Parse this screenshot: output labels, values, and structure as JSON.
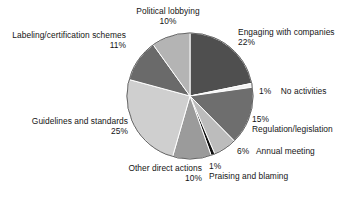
{
  "chart_data": {
    "type": "pie",
    "title": "",
    "subtitle": "",
    "xlabel": "",
    "ylabel": "",
    "legend_position": "none",
    "grid": false,
    "units": "percent",
    "total": 100,
    "start_angle_deg": 0,
    "direction": "clockwise",
    "categories": [
      "Engaging with companies",
      "No activities",
      "Regulation/legislation",
      "Annual meeting",
      "Praising and blaming",
      "Other direct actions",
      "Guidelines and standards",
      "Labeling/certification schemes",
      "Political lobbying"
    ],
    "values": [
      22,
      1,
      15,
      6,
      1,
      10,
      25,
      11,
      10
    ],
    "slices": [
      {
        "label": "Engaging with companies",
        "value": 22,
        "pct_text": "22%",
        "color": "#4f4f4f"
      },
      {
        "label": "No activities",
        "value": 1,
        "pct_text": "1%",
        "color": "#f2f2f2"
      },
      {
        "label": "Regulation/legislation",
        "value": 15,
        "pct_text": "15%",
        "color": "#6e6e6e"
      },
      {
        "label": "Annual meeting",
        "value": 6,
        "pct_text": "6%",
        "color": "#bcbcbc"
      },
      {
        "label": "Praising and blaming",
        "value": 1,
        "pct_text": "1%",
        "color": "#111111"
      },
      {
        "label": "Other direct actions",
        "value": 10,
        "pct_text": "10%",
        "color": "#9b9b9b"
      },
      {
        "label": "Guidelines and standards",
        "value": 25,
        "pct_text": "25%",
        "color": "#cfcfcf"
      },
      {
        "label": "Labeling/certification schemes",
        "value": 11,
        "pct_text": "11%",
        "color": "#6a6a6a"
      },
      {
        "label": "Political lobbying",
        "value": 10,
        "pct_text": "10%",
        "color": "#b4b4b4"
      }
    ],
    "annotations": {
      "political_lobbying": {
        "name": "Political lobbying",
        "pct": "10%"
      },
      "labeling": {
        "name": "Labeling/certification schemes",
        "pct": "11%"
      },
      "engaging": {
        "name": "Engaging with companies",
        "pct": "22%"
      },
      "no_activities": {
        "pct": "1%",
        "name": "No activities"
      },
      "regulation": {
        "pct": "15%",
        "name": "Regulation/legislation"
      },
      "annual_meeting": {
        "pct": "6%",
        "name": "Annual meeting"
      },
      "praising": {
        "pct": "1%",
        "name": "Praising and blaming"
      },
      "other_direct": {
        "name": "Other direct actions",
        "pct": "10%"
      },
      "guidelines": {
        "name": "Guidelines and standards",
        "pct": "25%"
      }
    }
  },
  "colors": {
    "background": "#ffffff",
    "text": "#141414",
    "slice_separator": "#ffffff",
    "pie_outline": "#555555"
  }
}
